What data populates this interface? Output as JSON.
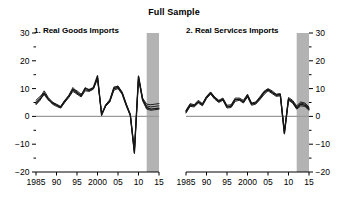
{
  "chart_data": {
    "type": "line",
    "title": "Full Sample",
    "xlabel": "",
    "ylabel": "",
    "grid": false,
    "legend": "none",
    "xlim": [
      1985,
      2015
    ],
    "ylim": [
      -20,
      30
    ],
    "ytick_labels": [
      "30",
      "20",
      "10",
      "0",
      "-10",
      "-20"
    ],
    "ytick_values": [
      30,
      20,
      10,
      0,
      -10,
      -20
    ],
    "yminor_values": [
      25,
      15,
      5,
      -5,
      -15
    ],
    "xtick_labels": [
      "1985",
      "90",
      "95",
      "2000",
      "05",
      "10",
      "15"
    ],
    "xtick_values": [
      1985,
      1990,
      1995,
      2000,
      2005,
      2010,
      2015
    ],
    "shaded_region": {
      "label": "forecast-band",
      "start": 2012,
      "end": 2015,
      "color": "#b3b3b3"
    },
    "zero_line_color": "#9a9a9a",
    "series_color": "#151515",
    "panels": [
      {
        "id": "panel-1",
        "title": "1. Real Goods Imports",
        "ylabel_side": "left",
        "x": [
          1985,
          1986,
          1987,
          1988,
          1989,
          1990,
          1991,
          1992,
          1993,
          1994,
          1995,
          1996,
          1997,
          1998,
          1999,
          2000,
          2001,
          2002,
          2003,
          2004,
          2005,
          2006,
          2007,
          2008,
          2009,
          2010,
          2011,
          2012,
          2013,
          2014,
          2015
        ],
        "series": [
          {
            "name": "Actual / baseline",
            "values": [
              4.6,
              6.2,
              8.0,
              6.0,
              4.8,
              4.0,
              3.2,
              5.4,
              7.2,
              9.6,
              8.4,
              7.4,
              10.0,
              9.6,
              10.4,
              14.6,
              0.4,
              4.0,
              5.6,
              10.0,
              10.4,
              8.4,
              4.2,
              0.6,
              -13.0,
              14.4,
              6.2,
              3.2,
              2.6,
              2.8,
              3.0
            ]
          },
          {
            "name": "Model variant A",
            "values": [
              5.2,
              6.8,
              9.2,
              6.8,
              5.2,
              4.2,
              3.4,
              5.6,
              7.6,
              10.4,
              8.8,
              7.6,
              10.4,
              9.4,
              10.2,
              14.0,
              1.0,
              4.2,
              6.0,
              10.6,
              10.8,
              8.8,
              4.6,
              0.8,
              -12.0,
              14.0,
              6.6,
              4.4,
              4.2,
              4.4,
              4.6
            ]
          },
          {
            "name": "Model variant B",
            "values": [
              4.2,
              5.8,
              8.6,
              6.4,
              4.4,
              3.6,
              3.0,
              5.0,
              6.8,
              9.0,
              8.0,
              7.0,
              9.2,
              9.0,
              9.8,
              13.4,
              0.6,
              3.6,
              5.2,
              9.4,
              10.0,
              8.0,
              3.8,
              0.2,
              -12.6,
              13.4,
              5.6,
              2.6,
              2.2,
              2.4,
              2.6
            ]
          },
          {
            "name": "Model variant C",
            "values": [
              5.8,
              7.2,
              8.4,
              6.2,
              5.0,
              4.4,
              3.6,
              5.8,
              7.4,
              9.8,
              9.2,
              8.0,
              9.6,
              9.2,
              10.0,
              14.2,
              0.8,
              3.8,
              5.4,
              10.2,
              11.0,
              8.6,
              4.4,
              0.4,
              -13.4,
              14.6,
              6.0,
              3.8,
              3.4,
              3.6,
              3.8
            ]
          }
        ]
      },
      {
        "id": "panel-2",
        "title": "2. Real Services Imports",
        "ylabel_side": "right",
        "x": [
          1985,
          1986,
          1987,
          1988,
          1989,
          1990,
          1991,
          1992,
          1993,
          1994,
          1995,
          1996,
          1997,
          1998,
          1999,
          2000,
          2001,
          2002,
          2003,
          2004,
          2005,
          2006,
          2007,
          2008,
          2009,
          2010,
          2011,
          2012,
          2013,
          2014,
          2015
        ],
        "series": [
          {
            "name": "Actual / baseline",
            "values": [
              1.6,
              4.0,
              3.8,
              5.2,
              4.2,
              6.8,
              8.4,
              6.6,
              5.4,
              6.2,
              3.4,
              3.6,
              6.0,
              6.2,
              5.2,
              7.4,
              4.4,
              4.8,
              6.4,
              8.4,
              9.6,
              8.6,
              7.6,
              7.8,
              -6.0,
              6.2,
              5.2,
              3.0,
              4.4,
              4.0,
              2.6
            ]
          },
          {
            "name": "Model variant A",
            "values": [
              2.2,
              4.6,
              4.2,
              5.8,
              4.6,
              7.2,
              8.8,
              7.0,
              5.8,
              6.6,
              4.0,
              4.2,
              6.6,
              6.6,
              5.8,
              8.0,
              4.8,
              5.2,
              7.0,
              9.0,
              10.0,
              9.2,
              8.0,
              8.2,
              -5.4,
              6.8,
              5.8,
              3.8,
              5.2,
              4.8,
              3.4
            ]
          },
          {
            "name": "Model variant B",
            "values": [
              1.2,
              3.6,
              3.4,
              4.8,
              3.8,
              6.4,
              8.0,
              6.2,
              5.0,
              5.8,
              3.0,
              3.2,
              5.4,
              5.8,
              4.8,
              7.0,
              4.0,
              4.4,
              6.0,
              7.8,
              9.2,
              8.2,
              7.2,
              7.4,
              -6.4,
              5.8,
              4.8,
              2.6,
              3.8,
              3.6,
              2.2
            ]
          },
          {
            "name": "Model variant C",
            "values": [
              2.0,
              4.2,
              4.0,
              5.4,
              4.4,
              7.0,
              8.6,
              6.8,
              5.6,
              6.0,
              3.6,
              3.8,
              6.2,
              6.0,
              5.4,
              7.6,
              4.6,
              5.0,
              6.6,
              8.8,
              9.8,
              8.8,
              7.8,
              8.0,
              -5.8,
              6.4,
              5.4,
              3.4,
              4.8,
              4.4,
              3.0
            ]
          }
        ]
      }
    ]
  }
}
